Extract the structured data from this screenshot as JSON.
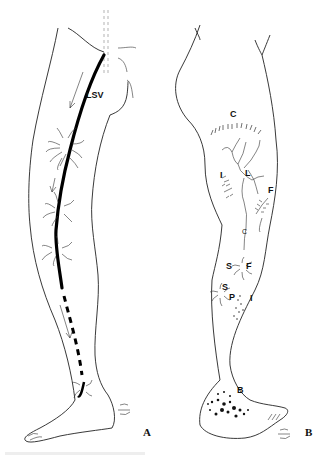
{
  "figure": {
    "panels": [
      {
        "id": "A",
        "label": "A",
        "view": "medial leg",
        "labels": [
          {
            "text": "LSV"
          }
        ]
      },
      {
        "id": "B",
        "label": "B",
        "view": "posterior-lateral leg",
        "labels": [
          {
            "text": "C"
          },
          {
            "text": "L"
          },
          {
            "text": "I"
          },
          {
            "text": "F"
          },
          {
            "text": "C",
            "small": true
          },
          {
            "text": "S"
          },
          {
            "text": "F"
          },
          {
            "text": "S"
          },
          {
            "text": "P"
          },
          {
            "text": "I"
          },
          {
            "text": "B"
          }
        ]
      }
    ],
    "colors": {
      "ink": "#111111",
      "background": "#ffffff"
    }
  }
}
